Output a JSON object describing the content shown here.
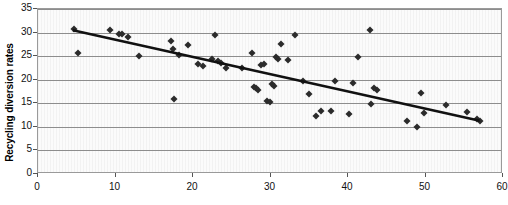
{
  "chart_data": {
    "type": "scatter",
    "title": "",
    "xlabel": "",
    "ylabel": "Recycling diversion rates",
    "xlim": [
      0,
      60
    ],
    "ylim": [
      0,
      35
    ],
    "xticks": [
      0,
      10,
      20,
      30,
      40,
      50,
      60
    ],
    "yticks": [
      0,
      5,
      10,
      15,
      20,
      25,
      30,
      35
    ],
    "grid": "horizontal",
    "legend": "none",
    "series": [
      {
        "name": "observations",
        "marker": "diamond",
        "color": "#2b2b2b",
        "points": [
          [
            4.6,
            30.8
          ],
          [
            5.2,
            25.7
          ],
          [
            9.3,
            30.6
          ],
          [
            10.4,
            29.8
          ],
          [
            10.9,
            29.6
          ],
          [
            11.6,
            29.1
          ],
          [
            13.0,
            25.1
          ],
          [
            17.1,
            28.2
          ],
          [
            17.4,
            26.5
          ],
          [
            17.6,
            16.0
          ],
          [
            18.2,
            25.3
          ],
          [
            19.4,
            27.3
          ],
          [
            20.7,
            23.4
          ],
          [
            21.3,
            22.9
          ],
          [
            22.4,
            24.3
          ],
          [
            22.8,
            29.4
          ],
          [
            23.2,
            23.9
          ],
          [
            23.6,
            23.6
          ],
          [
            24.2,
            22.5
          ],
          [
            26.3,
            22.4
          ],
          [
            27.6,
            25.6
          ],
          [
            27.9,
            18.5
          ],
          [
            28.1,
            18.2
          ],
          [
            28.4,
            17.9
          ],
          [
            28.8,
            23.1
          ],
          [
            29.1,
            23.4
          ],
          [
            29.6,
            15.4
          ],
          [
            29.9,
            15.2
          ],
          [
            30.2,
            19.0
          ],
          [
            30.4,
            18.6
          ],
          [
            30.7,
            24.9
          ],
          [
            31.0,
            24.3
          ],
          [
            31.4,
            27.5
          ],
          [
            32.3,
            24.1
          ],
          [
            33.1,
            29.5
          ],
          [
            34.2,
            19.7
          ],
          [
            35.0,
            16.9
          ],
          [
            35.9,
            12.4
          ],
          [
            36.5,
            13.3
          ],
          [
            37.8,
            13.4
          ],
          [
            38.3,
            19.8
          ],
          [
            40.1,
            12.7
          ],
          [
            40.6,
            19.4
          ],
          [
            41.3,
            24.8
          ],
          [
            42.8,
            30.6
          ],
          [
            43.0,
            14.9
          ],
          [
            43.3,
            18.3
          ],
          [
            43.7,
            17.8
          ],
          [
            47.6,
            11.2
          ],
          [
            48.9,
            10.0
          ],
          [
            49.4,
            17.2
          ],
          [
            49.8,
            13.0
          ],
          [
            52.7,
            14.6
          ],
          [
            55.3,
            13.1
          ],
          [
            56.6,
            11.6
          ],
          [
            57.0,
            11.3
          ]
        ]
      }
    ],
    "trendline": {
      "name": "linear fit",
      "color": "#111111",
      "x_start": 4.5,
      "y_start": 30.5,
      "x_end": 57.0,
      "y_end": 11.3
    }
  }
}
